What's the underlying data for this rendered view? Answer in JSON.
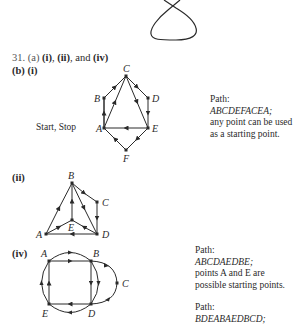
{
  "problem": {
    "number": "31.",
    "part_a_label": "(a)",
    "part_a_answer_1": "(i)",
    "part_a_sep_1": ", ",
    "part_a_answer_2": "(ii)",
    "part_a_sep_2": ", and ",
    "part_a_answer_3": "(iv)",
    "part_b_label": "(b)",
    "part_b_first": "(i)"
  },
  "graphs": {
    "g1": {
      "label": "(i)",
      "start_stop": "Start, Stop",
      "nodes": [
        "A",
        "B",
        "C",
        "D",
        "E",
        "F"
      ],
      "path_title": "Path:",
      "path": "ABCDEFACEA;",
      "note_1": "any point can be used",
      "note_2": "as a starting point."
    },
    "g2": {
      "label": "(ii)",
      "nodes": [
        "A",
        "B",
        "C",
        "D",
        "E"
      ]
    },
    "g4": {
      "label": "(iv)",
      "nodes": [
        "A",
        "B",
        "C",
        "D",
        "E"
      ],
      "path1_title": "Path:",
      "path1": "ABCDAEDBE;",
      "path1_note_1": "points A and E are",
      "path1_note_2": "possible starting points.",
      "path2_title": "Path:",
      "path2": "BDEABAEDBCD;"
    }
  },
  "colors": {
    "ink": "#2a2a2a",
    "background": "#ffffff"
  }
}
